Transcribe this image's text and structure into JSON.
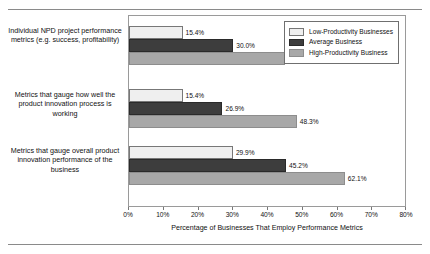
{
  "chart_data": {
    "type": "bar",
    "orientation": "horizontal",
    "title": "",
    "xlabel": "Percentage of Businesses That Employ Performance Metrics",
    "ylabel": "",
    "xlim": [
      0,
      80
    ],
    "xtick_labels": [
      "0%",
      "10%",
      "20%",
      "30%",
      "40%",
      "50%",
      "60%",
      "70%",
      "80%"
    ],
    "xtick_values": [
      0,
      10,
      20,
      30,
      40,
      50,
      60,
      70,
      80
    ],
    "grid": false,
    "legend_position": "top-right",
    "categories": [
      "Individual NPD project performance metrics (e.g. success, profitability)",
      "Metrics that gauge how well the product innovation process is working",
      "Metrics that gauge overall product innovation performance of the business"
    ],
    "series": [
      {
        "name": "Low-Productivity Businesses",
        "color": "#efefef",
        "values": [
          15.4,
          15.4,
          29.9
        ],
        "labels": [
          "15.4%",
          "15.4%",
          "29.9%"
        ]
      },
      {
        "name": "Average Business",
        "color": "#3d3d3d",
        "values": [
          30.0,
          26.9,
          45.2
        ],
        "labels": [
          "30.0%",
          "26.9%",
          "45.2%"
        ]
      },
      {
        "name": "High-Productivity Business",
        "color": "#a8a8a8",
        "values": [
          44.8,
          48.3,
          62.1
        ],
        "labels": [
          "44.8%",
          "48.3%",
          "62.1%"
        ]
      }
    ]
  },
  "legend": {
    "items": [
      "Low-Productivity Businesses",
      "Average Business",
      "High-Productivity Business"
    ]
  },
  "axis": {
    "title": "Percentage of Businesses That Employ Performance Metrics",
    "ticks": [
      "0%",
      "10%",
      "20%",
      "30%",
      "40%",
      "50%",
      "60%",
      "70%",
      "80%"
    ]
  },
  "categories": {
    "c0": "Individual NPD project performance metrics (e.g. success, profitability)",
    "c1": "Metrics that gauge how well the product innovation process is working",
    "c2": "Metrics that gauge overall product innovation performance of the business"
  },
  "values": {
    "g0": {
      "v0": "15.4%",
      "v1": "30.0%",
      "v2": "44.8%"
    },
    "g1": {
      "v0": "15.4%",
      "v1": "26.9%",
      "v2": "48.3%"
    },
    "g2": {
      "v0": "29.9%",
      "v1": "45.2%",
      "v2": "62.1%"
    }
  }
}
